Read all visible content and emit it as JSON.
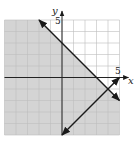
{
  "chart_data": {
    "type": "line",
    "title": "",
    "xlabel": "x",
    "ylabel": "y",
    "xlim": [
      -5,
      5
    ],
    "ylim": [
      -5,
      5
    ],
    "grid": true,
    "tick_labels": {
      "x": [
        "5"
      ],
      "y": [
        "5"
      ]
    },
    "series": [
      {
        "name": "boundary-1",
        "equation": "y = -x + 3",
        "points": [
          [
            -2,
            5
          ],
          [
            5,
            -2
          ]
        ],
        "arrows": "both"
      },
      {
        "name": "boundary-2",
        "equation": "y = x - 5",
        "points": [
          [
            0,
            -5
          ],
          [
            5,
            0
          ]
        ],
        "arrows": "both"
      }
    ],
    "shaded_region": "y <= -x + 3",
    "intersection": [
      4,
      -1
    ],
    "colors": {
      "shade": "#d4d4d4",
      "grid": "#bdbdbd",
      "axis": "#222222",
      "line": "#1a1a1a",
      "background": "#ffffff"
    }
  },
  "labels": {
    "x_axis": "x",
    "y_axis": "y",
    "x_tick": "5",
    "y_tick": "5"
  }
}
